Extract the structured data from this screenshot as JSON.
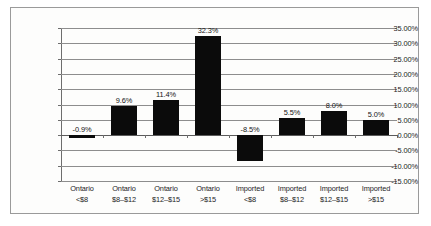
{
  "chart_data": {
    "type": "bar",
    "title": "",
    "subtitle": "",
    "xlabel": "",
    "ylabel": "",
    "categories": [
      {
        "line1": "Ontario",
        "line2": "<$8"
      },
      {
        "line1": "Ontario",
        "line2": "$8–$12"
      },
      {
        "line1": "Ontario",
        "line2": "$12–$15"
      },
      {
        "line1": "Ontario",
        "line2": ">$15"
      },
      {
        "line1": "Imported",
        "line2": "<$8"
      },
      {
        "line1": "Imported",
        "line2": "$8–$12"
      },
      {
        "line1": "Imported",
        "line2": "$12–$15"
      },
      {
        "line1": "Imported",
        "line2": ">$15"
      }
    ],
    "values": [
      -0.9,
      9.6,
      11.4,
      32.3,
      -8.5,
      5.5,
      8.0,
      5.0
    ],
    "data_labels": [
      "-0.9%",
      "9.6%",
      "11.4%",
      "32.3%",
      "-8.5%",
      "5.5%",
      "8.0%",
      "5.0%"
    ],
    "ylim": [
      -15,
      35
    ],
    "ytick_values": [
      35,
      30,
      25,
      20,
      15,
      10,
      5,
      0,
      -5,
      -10,
      -15
    ],
    "ytick_labels": [
      "35.00%",
      "30.00%",
      "25.00%",
      "20.00%",
      "15.00%",
      "10.00%",
      "5.00%",
      "0.00%",
      "-5.00%",
      "-10.00%",
      "-15.00%"
    ],
    "grid": true,
    "legend": null,
    "bar_color": "#0b0b0b",
    "gridline_color": "#8d8d8d",
    "axis_color": "#6d6d6d",
    "background_color": "#fdfdfc"
  }
}
